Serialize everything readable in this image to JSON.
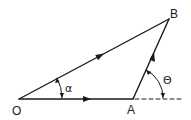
{
  "diagram": {
    "type": "vector-triangle",
    "points": {
      "O": {
        "label": "O",
        "x": 19,
        "y": 99
      },
      "A": {
        "label": "A",
        "x": 133,
        "y": 99
      },
      "B": {
        "label": "B",
        "x": 169,
        "y": 19
      }
    },
    "vectors": [
      {
        "from": "O",
        "to": "A",
        "name": "OA"
      },
      {
        "from": "A",
        "to": "B",
        "name": "AB"
      },
      {
        "from": "O",
        "to": "B",
        "name": "OB"
      }
    ],
    "angles": {
      "alpha": {
        "label": "α",
        "vertex": "O",
        "between": [
          "OA",
          "OB"
        ]
      },
      "theta": {
        "label": "Θ",
        "vertex": "A",
        "between": [
          "extension of OA",
          "AB"
        ]
      }
    },
    "extension_line": {
      "style": "dashed",
      "from": "A",
      "direction": "along OA"
    },
    "colors": {
      "stroke": "#1a1a1a",
      "background": "#ffffff"
    }
  }
}
